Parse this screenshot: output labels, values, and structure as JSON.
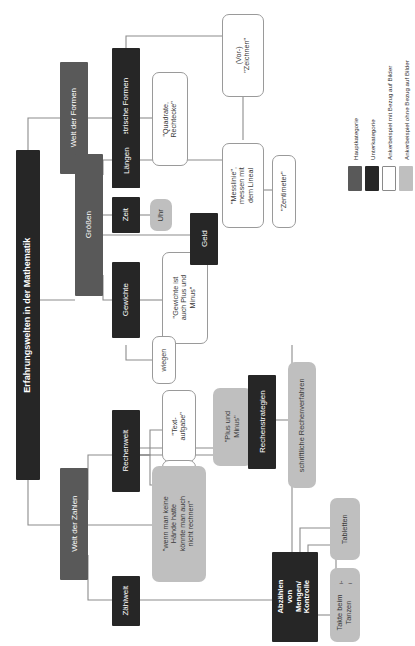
{
  "diagram": {
    "title": "Erfahrungswelten in der Mathematik",
    "nodes": {
      "root": "Erfahrungswelten in der Mathematik",
      "welt_der_formen": "Welt der Formen",
      "geometrische_formen": "Geometrische Formen",
      "quadrate_rechtecke": "\"Quadrate,\nRechtecke\"",
      "vor_zeichnen": "(Vor-)\n\"Zeichnen\"",
      "groessen": "Größen",
      "laengen": "Längen",
      "messlinie": "\"Messlinie\",\nmessen mit\ndem Lineal",
      "zentimeter": "\"Zentimeter\"",
      "zeit": "Zeit",
      "uhr": "Uhr",
      "gewichte": "Gewichte",
      "gewichte_plus_minus": "\"Gewichte ist\nauch Plus und\nMinus\"",
      "wiegen": "wiegen",
      "geld": "Geld",
      "welt_der_zahlen": "Welt der Zahlen",
      "rechenwelt": "Rechenwelt",
      "textaufgabe": "\"Text-\naufgabe\"",
      "gleich_ergebnis": "\"Gleich\",\n\"Ergebnis\"",
      "plus_und_minus": "\"Plus und\nMinus\"",
      "rechenstrategien": "Rechenstrategien",
      "schriftliche_rechenverfahren": "schriftliche Rechenverfahren",
      "haende_rechnen": "\"wenn man keine\nHände hatte\nkönnte man auch\nnicht rechnen\"",
      "zaehlwelt": "Zählwelt",
      "abzaehlen": "Abzählen\nvon\nMengen/\nKontrolle",
      "tabletten": "Tabletten",
      "notenlinien": "Noten-\nlinien",
      "takte_tanzen": "Takte beim\nTanzen"
    }
  },
  "legend": {
    "items": [
      {
        "label": "Hauptkategorie",
        "color": "#595959"
      },
      {
        "label": "Unterkategorie",
        "color": "#262626"
      },
      {
        "label": "Ankerbeispiel mit Bezug auf Bilder",
        "color": "#ffffff"
      },
      {
        "label": "Ankerbeispiel ohne Bezug auf Bilder",
        "color": "#bfbfbf"
      }
    ]
  },
  "style": {
    "edge_color": "#8c8c8c",
    "background": "#ffffff"
  }
}
